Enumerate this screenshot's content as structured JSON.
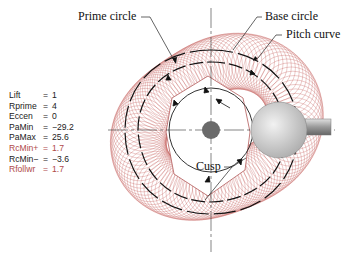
{
  "labels": {
    "prime_circle": "Prime circle",
    "base_circle": "Base circle",
    "pitch_curve": "Pitch curve",
    "cusp": "Cusp"
  },
  "parameters": [
    {
      "name": "Lift",
      "eq": "=",
      "value": "1",
      "color": "#222222"
    },
    {
      "name": "Rprime",
      "eq": "=",
      "value": "4",
      "color": "#222222"
    },
    {
      "name": "Eccen",
      "eq": "=",
      "value": "0",
      "color": "#222222"
    },
    {
      "name": "PaMin",
      "eq": "=",
      "value": "−29.2",
      "color": "#222222"
    },
    {
      "name": "PaMax",
      "eq": "=",
      "value": "25.6",
      "color": "#222222"
    },
    {
      "name": "RcMin+",
      "eq": "=",
      "value": "1.7",
      "color": "#b04a4a"
    },
    {
      "name": "RcMin−",
      "eq": "=",
      "value": "−3.6",
      "color": "#222222"
    },
    {
      "name": "Rfollwr",
      "eq": "=",
      "value": "1.7",
      "color": "#b04a4a"
    }
  ],
  "colors": {
    "envelope": "#c0504d",
    "ink": "#1a1a1a",
    "hub": "#6a6a6a",
    "roller": "#c8c8c8"
  }
}
